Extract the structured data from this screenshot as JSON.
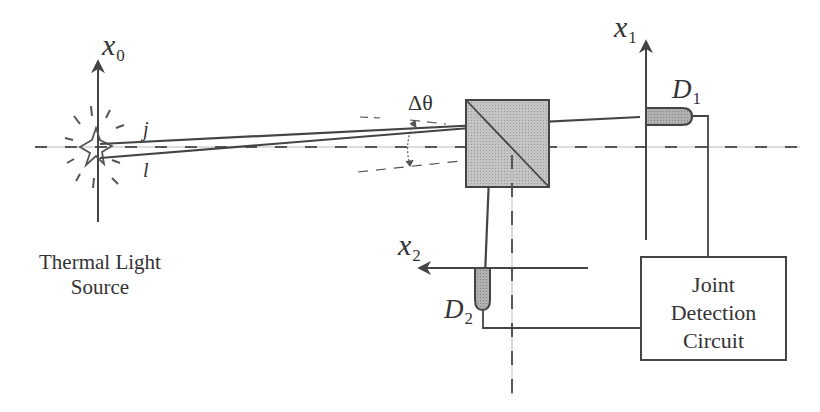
{
  "diagram": {
    "colors": {
      "line": "#444444",
      "dash": "#555555",
      "cube_fill": "#bdbdbd",
      "detector_fill": "#a8a8a8",
      "background": "#ffffff"
    },
    "source": {
      "axis_label": "x",
      "axis_subscript": "0",
      "label_line1": "Thermal Light",
      "label_line2": "Source",
      "ray_labels": {
        "upper": "j",
        "lower": "l"
      }
    },
    "beam_splitter": {
      "angle_label": "Δθ"
    },
    "detector1": {
      "axis_label": "x",
      "axis_subscript": "1",
      "name": "D",
      "name_subscript": "1"
    },
    "detector2": {
      "axis_label": "x",
      "axis_subscript": "2",
      "name": "D",
      "name_subscript": "2"
    },
    "circuit": {
      "line1": "Joint",
      "line2": "Detection",
      "line3": "Circuit"
    }
  }
}
